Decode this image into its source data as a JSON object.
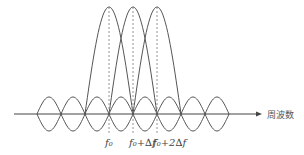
{
  "diagram": {
    "type": "ofdm-subcarrier-spectrum",
    "axis_label": "周波数",
    "subcarrier_labels": [
      "f₀",
      "f₀+∆f",
      "f₀+2∆f"
    ],
    "colors": {
      "curve": "#555555",
      "axis": "#444444",
      "dash": "#888888",
      "text": "#444444"
    },
    "geometry": {
      "axis_y": 114,
      "axis_x_start": 14,
      "axis_x_end": 262,
      "node_spacing": 24,
      "first_node_x": 37,
      "node_count": 9,
      "small_lobe_amplitude": 17,
      "peak_centers_x": [
        109,
        133,
        157
      ],
      "peak_top_y": 7,
      "dash_bottom_y": 135,
      "label_y": 146
    }
  }
}
